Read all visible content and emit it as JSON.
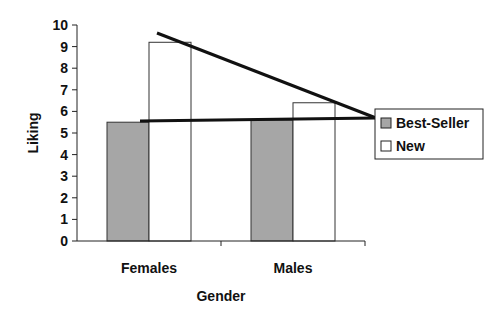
{
  "chart_data": {
    "type": "bar",
    "title": "",
    "xlabel": "Gender",
    "ylabel": "Liking",
    "ylim": [
      0,
      10
    ],
    "yticks": [
      0,
      1,
      2,
      3,
      4,
      5,
      6,
      7,
      8,
      9,
      10
    ],
    "categories": [
      "Females",
      "Males"
    ],
    "series": [
      {
        "name": "Best-Seller",
        "values": [
          5.5,
          5.6
        ],
        "color": "#a6a6a6"
      },
      {
        "name": "New",
        "values": [
          9.2,
          6.4
        ],
        "color": "#ffffff"
      }
    ],
    "grid": false,
    "legend_position": "right",
    "annotations": [
      {
        "type": "line",
        "description": "Line from top of Females New bar descending toward legend",
        "from": [
          157,
          33
        ],
        "to": [
          376,
          118
        ]
      },
      {
        "type": "line",
        "description": "Horizontal line along Best-Seller bar tops toward legend",
        "from": [
          140,
          121
        ],
        "to": [
          376,
          118
        ]
      }
    ]
  }
}
